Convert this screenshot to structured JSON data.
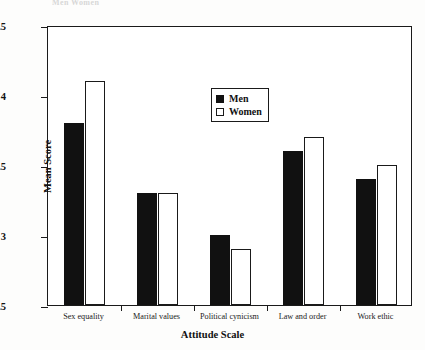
{
  "ghost_title_text": "Men  Women",
  "chart_data": {
    "type": "bar",
    "title": "",
    "xlabel": "Attitude Scale",
    "ylabel": "Mean Score",
    "ylim": [
      2.5,
      4.5
    ],
    "ytick_values": [
      2.5,
      3,
      3.5,
      4,
      4.5
    ],
    "ytick_labels": [
      "2.5",
      "3",
      "3.5",
      "4",
      "4.5"
    ],
    "grid": false,
    "legend_position": "upper center inside",
    "categories": [
      "Sex equality",
      "Marital values",
      "Political cynicism",
      "Law and order",
      "Work ethic"
    ],
    "series": [
      {
        "name": "Men",
        "swatch": "filled",
        "color": "#111111",
        "values": [
          3.8,
          3.3,
          3.0,
          3.6,
          3.4
        ]
      },
      {
        "name": "Women",
        "swatch": "outline",
        "color": "#ffffff",
        "values": [
          4.1,
          3.3,
          2.9,
          3.7,
          3.5
        ]
      }
    ]
  }
}
